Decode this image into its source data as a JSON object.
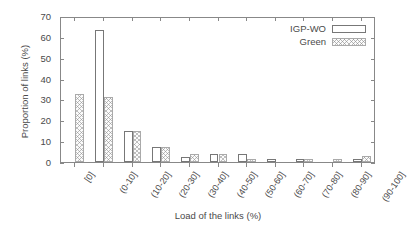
{
  "chart_data": {
    "type": "bar",
    "title": "",
    "xlabel": "Load of the links (%)",
    "ylabel": "Proportion of links (%)",
    "categories": [
      "[0]",
      "(0-10]",
      "(10-20]",
      "(20-30]",
      "(30-40]",
      "(40-50]",
      "(50-60]",
      "(60-70]",
      "(70-80]",
      "(80-90]",
      "(90-100]"
    ],
    "series": [
      {
        "name": "IGP-WO",
        "style": "open-white",
        "values": [
          0,
          63.5,
          15,
          7,
          2.5,
          4,
          4,
          1.5,
          1.5,
          0,
          1.5
        ]
      },
      {
        "name": "Green",
        "style": "crosshatch",
        "values": [
          32.5,
          31,
          15,
          7,
          4,
          4,
          1.5,
          0,
          1.5,
          1.5,
          3
        ]
      }
    ],
    "ylim": [
      0,
      70
    ],
    "yticks": [
      0,
      10,
      20,
      30,
      40,
      50,
      60,
      70
    ],
    "grid": false,
    "legend_position": "top-right",
    "xtick_rotation": -56
  },
  "legend": {
    "entries": [
      {
        "label": "IGP-WO"
      },
      {
        "label": "Green"
      }
    ]
  },
  "colors": {
    "axis": "#888888",
    "text": "#4a4a4a",
    "igp_border": "#777777",
    "igp_fill": "#ffffff",
    "green_border": "#aaaaaa",
    "green_hatch": "#8c8c8c",
    "background": "#ffffff"
  }
}
